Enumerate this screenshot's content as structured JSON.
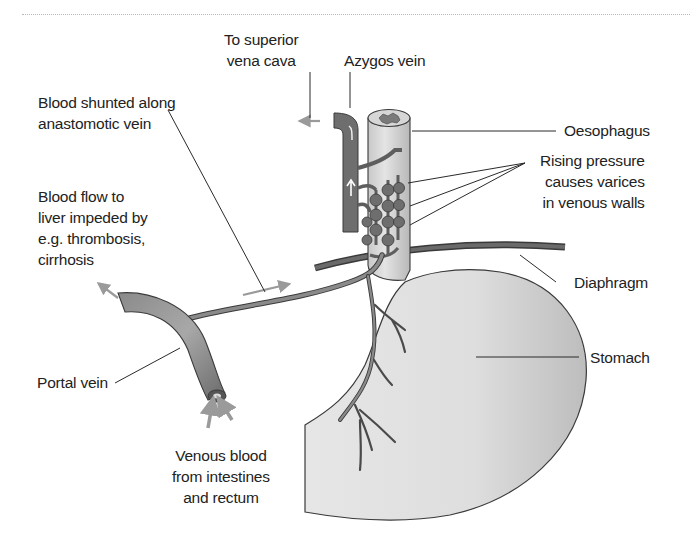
{
  "diagram": {
    "type": "anatomical-illustration",
    "colors": {
      "vein": "#6f6f6f",
      "vein_highlight": "#b9b9b9",
      "organ": "#dcdcdc",
      "organ_edge": "#3a3a3a",
      "flow_arrow": "#9a9a9a",
      "leader_line": "#2a2a2a"
    }
  },
  "labels": {
    "superior_vena_cava": "To superior\nvena cava",
    "azygos_vein": "Azygos vein",
    "oesophagus": "Oesophagus",
    "shunted_blood": "Blood shunted along\nanastomotic vein",
    "rising_pressure": "Rising pressure\ncauses varices\nin venous walls",
    "impeded_flow": "Blood flow to\nliver impeded by\ne.g. thrombosis,\ncirrhosis",
    "diaphragm": "Diaphragm",
    "stomach": "Stomach",
    "portal_vein": "Portal vein",
    "venous_blood": "Venous blood\nfrom intestines\nand rectum"
  }
}
